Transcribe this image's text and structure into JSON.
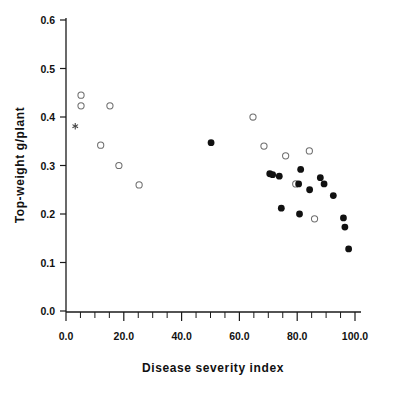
{
  "chart_data": {
    "type": "scatter",
    "title": "",
    "xlabel": "Disease severity index",
    "ylabel": "Top-weight g/plant",
    "xlim": [
      0,
      100
    ],
    "ylim": [
      0.0,
      0.6
    ],
    "grid": false,
    "legend": "none",
    "x_ticks": [
      0,
      20,
      40,
      60,
      80,
      100
    ],
    "x_tick_labels": [
      "0.0",
      "20.0",
      "40.0",
      "60.0",
      "80.0",
      "100.0"
    ],
    "x_minor_step": 5,
    "y_ticks": [
      0.0,
      0.1,
      0.2,
      0.3,
      0.4,
      0.5,
      0.6
    ],
    "y_tick_labels": [
      "0.0",
      "0.1",
      "0.2",
      "0.3",
      "0.4",
      "0.5",
      "0.6"
    ],
    "series": [
      {
        "name": "open",
        "marker": "open-circle",
        "color": "#6e6e6e",
        "points": [
          [
            5.2,
            0.445
          ],
          [
            5.2,
            0.423
          ],
          [
            15.2,
            0.423
          ],
          [
            12.0,
            0.342
          ],
          [
            18.3,
            0.3
          ],
          [
            25.3,
            0.26
          ],
          [
            64.7,
            0.4
          ],
          [
            68.5,
            0.34
          ],
          [
            76.0,
            0.32
          ],
          [
            84.2,
            0.33
          ],
          [
            79.5,
            0.262
          ],
          [
            86.0,
            0.19
          ]
        ]
      },
      {
        "name": "filled",
        "marker": "filled-circle",
        "color": "#111111",
        "points": [
          [
            50.2,
            0.347
          ],
          [
            70.5,
            0.283
          ],
          [
            71.5,
            0.281
          ],
          [
            73.8,
            0.278
          ],
          [
            81.2,
            0.292
          ],
          [
            80.5,
            0.262
          ],
          [
            88.0,
            0.275
          ],
          [
            84.3,
            0.25
          ],
          [
            89.3,
            0.262
          ],
          [
            92.5,
            0.238
          ],
          [
            74.5,
            0.212
          ],
          [
            80.8,
            0.2
          ],
          [
            96.0,
            0.192
          ],
          [
            96.5,
            0.173
          ],
          [
            97.8,
            0.128
          ]
        ]
      },
      {
        "name": "star",
        "marker": "asterisk",
        "color": "#444444",
        "points": [
          [
            3.2,
            0.381
          ]
        ]
      }
    ]
  },
  "axes": {
    "x_title": "Disease severity index",
    "y_title": "Top-weight g/plant"
  }
}
